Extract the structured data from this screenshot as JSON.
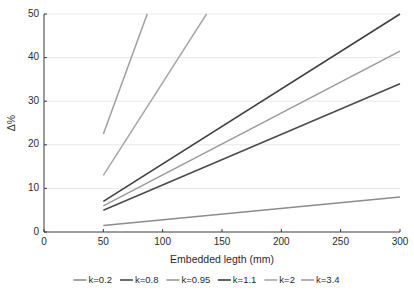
{
  "chart_data": {
    "type": "line",
    "title": "",
    "subtitle": "",
    "xlabel": "Embedded legth (mm)",
    "ylabel": "Δ%",
    "xlim": [
      0,
      300
    ],
    "ylim": [
      0,
      50
    ],
    "xticks": [
      0,
      50,
      100,
      150,
      200,
      250,
      300
    ],
    "yticks": [
      0,
      10,
      20,
      30,
      40,
      50
    ],
    "xtick_labels": [
      "0",
      "50",
      "100",
      "150",
      "200",
      "250",
      "300"
    ],
    "ytick_labels": [
      "0",
      "10",
      "20",
      "30",
      "40",
      "50"
    ],
    "grid": "horizontal",
    "legend_position": "below",
    "x": [
      50,
      300
    ],
    "series": [
      {
        "name": "k=0.2",
        "label": "k=0.2",
        "color": "#8c8c8c",
        "x": [
          50,
          300
        ],
        "values": [
          1.5,
          8.0
        ]
      },
      {
        "name": "k=0.8",
        "label": "k=0.8",
        "color": "#4a4a4a",
        "x": [
          50,
          300
        ],
        "values": [
          5.0,
          34.0
        ]
      },
      {
        "name": "k=0.95",
        "label": "k=0.95",
        "color": "#9a9a9a",
        "x": [
          50,
          300
        ],
        "values": [
          6.0,
          41.5
        ]
      },
      {
        "name": "k=1.1",
        "label": "k=1.1",
        "color": "#3d3d3d",
        "x": [
          50,
          300
        ],
        "values": [
          7.0,
          50.0
        ]
      },
      {
        "name": "k=2",
        "label": "k=2",
        "color": "#a8a8a8",
        "x": [
          50,
          137
        ],
        "values": [
          13.0,
          50.0
        ]
      },
      {
        "name": "k=3.4",
        "label": "k=3.4",
        "color": "#a0a0a0",
        "x": [
          50,
          87
        ],
        "values": [
          22.5,
          50.0
        ]
      }
    ]
  },
  "axes": {
    "x_title": "Embedded legth (mm)",
    "y_title": "Δ%"
  },
  "legend": {
    "items": [
      {
        "label": "k=0.2"
      },
      {
        "label": "k=0.8"
      },
      {
        "label": "k=0.95"
      },
      {
        "label": "k=1.1"
      },
      {
        "label": "k=2"
      },
      {
        "label": "k=3.4"
      }
    ]
  },
  "colors": {
    "axis": "#3a3a3a",
    "grid": "#e8e8e8",
    "background": "#ffffff",
    "text": "#2b2b2b"
  }
}
